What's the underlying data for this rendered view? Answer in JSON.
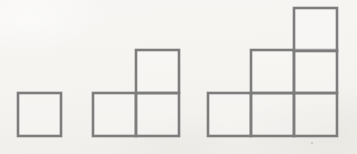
{
  "figure": {
    "background_color": "#f6f5f2",
    "stroke_color": "#7d7d7d",
    "fill_color": "#fbfaf8",
    "stroke_width": 2.6,
    "canvas": {
      "width": 357,
      "height": 154
    },
    "unit_cell_size": 43,
    "baseline_y": 136,
    "term_count": 3,
    "term_square_counts": [
      1,
      3,
      6
    ],
    "figures": [
      {
        "name": "figure-1",
        "term_number": 1,
        "square_count": 1,
        "origin_x": 18,
        "rows": [
          {
            "row_index": 0,
            "y": 93,
            "columns": [
              0
            ]
          }
        ],
        "squares": [
          {
            "id": "f1-r0-c0",
            "x": 18,
            "y": 93,
            "width": 43,
            "height": 43
          }
        ]
      },
      {
        "name": "figure-2",
        "term_number": 2,
        "square_count": 3,
        "origin_x": 93,
        "rows": [
          {
            "row_index": 0,
            "y": 93,
            "columns": [
              0,
              1
            ]
          },
          {
            "row_index": 1,
            "y": 50,
            "columns": [
              1
            ]
          }
        ],
        "squares": [
          {
            "id": "f2-r0-c0",
            "x": 93,
            "y": 93,
            "width": 43,
            "height": 43
          },
          {
            "id": "f2-r0-c1",
            "x": 136,
            "y": 93,
            "width": 43,
            "height": 43
          },
          {
            "id": "f2-r1-c1",
            "x": 136,
            "y": 50,
            "width": 43,
            "height": 43
          }
        ]
      },
      {
        "name": "figure-3",
        "term_number": 3,
        "square_count": 6,
        "origin_x": 208,
        "rows": [
          {
            "row_index": 0,
            "y": 93,
            "columns": [
              0,
              1,
              2
            ]
          },
          {
            "row_index": 1,
            "y": 50,
            "columns": [
              1,
              2
            ]
          },
          {
            "row_index": 2,
            "y": 8,
            "columns": [
              2
            ]
          }
        ],
        "squares": [
          {
            "id": "f3-r0-c0",
            "x": 208,
            "y": 93,
            "width": 43,
            "height": 43
          },
          {
            "id": "f3-r0-c1",
            "x": 251,
            "y": 93,
            "width": 43,
            "height": 43
          },
          {
            "id": "f3-r0-c2",
            "x": 294,
            "y": 93,
            "width": 43,
            "height": 43
          },
          {
            "id": "f3-r1-c1",
            "x": 251,
            "y": 50,
            "width": 43,
            "height": 43
          },
          {
            "id": "f3-r1-c2",
            "x": 294,
            "y": 50,
            "width": 43,
            "height": 43
          },
          {
            "id": "f3-r2-c2",
            "x": 294,
            "y": 8,
            "width": 43,
            "height": 43
          }
        ]
      }
    ],
    "marks": [
      {
        "name": "stray-speck",
        "x": 311,
        "y": 142
      }
    ]
  }
}
